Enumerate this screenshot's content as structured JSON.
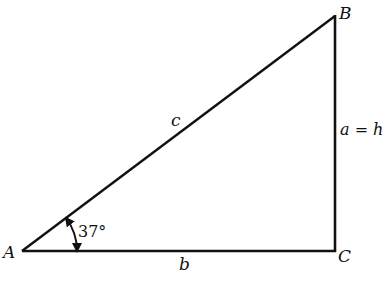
{
  "diagram": {
    "type": "right-triangle",
    "vertices": {
      "A": {
        "label": "A",
        "x": 22,
        "y": 251
      },
      "B": {
        "label": "B",
        "x": 335,
        "y": 16
      },
      "C": {
        "label": "C",
        "x": 335,
        "y": 251
      }
    },
    "sides": {
      "hypotenuse": {
        "label": "c"
      },
      "base": {
        "label": "b"
      },
      "vertical": {
        "label": "a = h"
      }
    },
    "angle": {
      "vertex": "A",
      "label": "37°"
    },
    "colors": {
      "stroke": "#111111",
      "background": "#ffffff"
    }
  }
}
